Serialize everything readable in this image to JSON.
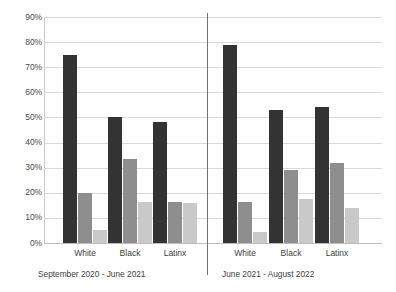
{
  "chart_data": {
    "type": "bar",
    "title": "",
    "xlabel": "",
    "ylabel": "",
    "ylim": [
      0,
      90
    ],
    "grid": true,
    "legend": "none",
    "ytick_labels": [
      "90%",
      "80%",
      "70%",
      "60%",
      "50%",
      "40%",
      "30%",
      "20%",
      "10%",
      "0%"
    ],
    "ytick_values": [
      90,
      80,
      70,
      60,
      50,
      40,
      30,
      20,
      10,
      0
    ],
    "categories": [
      "White",
      "Black",
      "Latinx"
    ],
    "panels": [
      {
        "label": "September 2020 - June 2021",
        "categories": [
          "White",
          "Black",
          "Latinx"
        ],
        "series": [
          {
            "name": "series-1",
            "color": "#333333",
            "values": [
              75,
              50,
              48
            ]
          },
          {
            "name": "series-2",
            "color": "#8e8e8e",
            "values": [
              20,
              33.5,
              16.5
            ]
          },
          {
            "name": "series-3",
            "color": "#c9c9c9",
            "values": [
              5.3,
              16.5,
              16
            ]
          }
        ]
      },
      {
        "label": "June 2021 - August 2022",
        "categories": [
          "White",
          "Black",
          "Latinx"
        ],
        "series": [
          {
            "name": "series-1",
            "color": "#333333",
            "values": [
              79,
              53,
              54
            ]
          },
          {
            "name": "series-2",
            "color": "#8e8e8e",
            "values": [
              16.5,
              29,
              32
            ]
          },
          {
            "name": "series-3",
            "color": "#c9c9c9",
            "values": [
              4.5,
              17.5,
              13.8
            ]
          }
        ]
      }
    ],
    "colors": {
      "series_1": "#333333",
      "series_2": "#8e8e8e",
      "series_3": "#c9c9c9",
      "gridline": "#d9d9d9",
      "axis": "#bdbdbd",
      "divider": "#707070",
      "text": "#3d3d3d",
      "background": "#ffffff"
    }
  }
}
